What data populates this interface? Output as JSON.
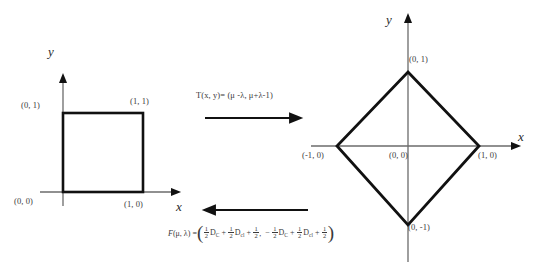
{
  "figure": {
    "background_color": "#ffffff",
    "shape_color": "#000000",
    "axis_color": "#6b6b6b",
    "text_color": "#3a3a3a"
  },
  "left_diagram": {
    "name": "unit-square",
    "y_axis_label": "y",
    "x_axis_label": "x",
    "vertices": [
      {
        "label": "(0, 0)",
        "x": 0,
        "y": 0
      },
      {
        "label": "(1, 0)",
        "x": 1,
        "y": 0
      },
      {
        "label": "(1, 1)",
        "x": 1,
        "y": 1
      },
      {
        "label": "(0, 1)",
        "x": 0,
        "y": 1
      }
    ]
  },
  "right_diagram": {
    "name": "diamond",
    "y_axis_label": "y",
    "x_axis_label": "x",
    "origin_label": "(0, 0)",
    "vertices": [
      {
        "label": "(0, 1)",
        "x": 0,
        "y": 1
      },
      {
        "label": "(1, 0)",
        "x": 1,
        "y": 0
      },
      {
        "label": "(0, -1)",
        "x": 0,
        "y": -1
      },
      {
        "label": "(-1, 0)",
        "x": -1,
        "y": 0
      }
    ]
  },
  "forward_transform": {
    "label": "T(x, y)= (μ -λ,  μ+λ-1)",
    "direction": "right"
  },
  "inverse_transform": {
    "direction": "left",
    "prefix": "F",
    "args": "(μ, λ) =",
    "open_paren": "(",
    "close_paren": ")",
    "terms": [
      {
        "sign": "",
        "num": "1",
        "den": "2",
        "symbol": "D",
        "sub": "C"
      },
      {
        "sign": "+",
        "num": "1",
        "den": "2",
        "symbol": "D",
        "sub": "cl"
      },
      {
        "sign": "+",
        "num": "1",
        "den": "2",
        "symbol": "",
        "sub": ""
      }
    ],
    "separator": ",",
    "terms2": [
      {
        "sign": "−",
        "num": "1",
        "den": "2",
        "symbol": "D",
        "sub": "C"
      },
      {
        "sign": "+",
        "num": "1",
        "den": "2",
        "symbol": "D",
        "sub": "cl"
      },
      {
        "sign": "+",
        "num": "1",
        "den": "2",
        "symbol": "",
        "sub": ""
      }
    ]
  }
}
